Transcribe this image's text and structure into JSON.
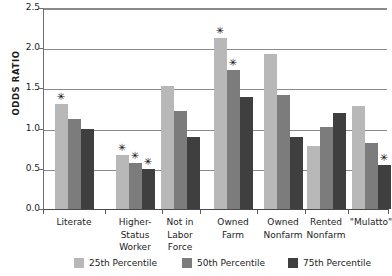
{
  "chart_data": {
    "type": "bar",
    "title": "",
    "xlabel": "",
    "ylabel": "ODDS RATIO",
    "ylim": [
      0.0,
      2.5
    ],
    "yticks": [
      "0.0",
      "0.5",
      "1.0",
      "1.5",
      "2.0",
      "2.5"
    ],
    "ytick_values": [
      0.0,
      0.5,
      1.0,
      1.5,
      2.0,
      2.5
    ],
    "grid": "horizontal",
    "legend_position": "bottom",
    "categories": [
      "Literate",
      "Higher-\nStatus\nWorker",
      "Not in\nLabor\nForce",
      "Owned\nFarm",
      "Owned\nNonfarm",
      "Rented\nNonfarm",
      "\"Mulatto\""
    ],
    "series": [
      {
        "name": "25th Percentile",
        "color": "#b8b8b8",
        "values": [
          1.31,
          0.67,
          1.53,
          2.13,
          1.93,
          0.78,
          1.28
        ],
        "significant": [
          true,
          true,
          false,
          true,
          false,
          false,
          false
        ]
      },
      {
        "name": "50th Percentile",
        "color": "#7c7c7c",
        "values": [
          1.12,
          0.57,
          1.22,
          1.73,
          1.42,
          1.02,
          0.82
        ],
        "significant": [
          false,
          true,
          false,
          true,
          false,
          false,
          false
        ]
      },
      {
        "name": "75th Percentile",
        "color": "#3f3f3f",
        "values": [
          1.0,
          0.5,
          0.9,
          1.39,
          0.9,
          1.19,
          0.55
        ],
        "significant": [
          false,
          true,
          false,
          false,
          false,
          false,
          true
        ]
      }
    ],
    "significance_marker": "✳",
    "group_centers_px": [
      74,
      135,
      180,
      233,
      283,
      326,
      371
    ]
  }
}
